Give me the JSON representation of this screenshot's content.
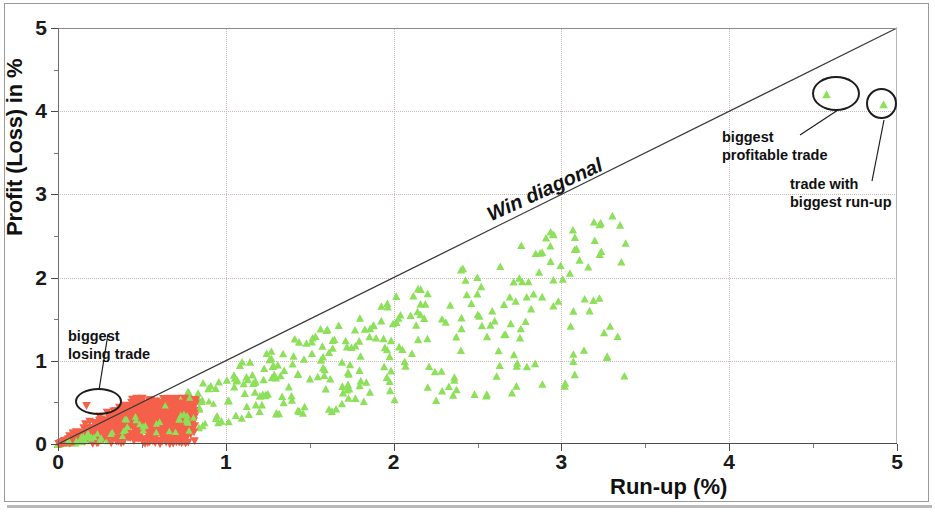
{
  "chart_data": {
    "type": "scatter",
    "title": "",
    "xlabel": "Run-up (%)",
    "ylabel": "Profit (Loss) in %",
    "xlim": [
      0,
      5
    ],
    "ylim": [
      0,
      5
    ],
    "xticks": [
      "0",
      "1",
      "2",
      "3",
      "4",
      "5"
    ],
    "yticks": [
      "0",
      "1",
      "2",
      "3",
      "4",
      "5"
    ],
    "xtick_values": [
      0,
      1,
      2,
      3,
      4,
      5
    ],
    "ytick_values": [
      0,
      1,
      2,
      3,
      4,
      5
    ],
    "minor_tick_step": 0.5,
    "grid": "dotted gridlines at integer ticks",
    "legend": "none",
    "reference_line": {
      "label": "Win diagonal",
      "from": [
        0,
        0
      ],
      "to": [
        5,
        5
      ],
      "note": "y = x diagonal; trades cannot exceed their run-up"
    },
    "series": [
      {
        "name": "losing trades",
        "color": "#F4604A",
        "marker": "triangle-down",
        "count": 520,
        "description": "Dense cluster hugging the origin, run-up 0 to ~0.8%, profit 0 to ~0.55%",
        "x_range": [
          0.0,
          0.82
        ],
        "y_range": [
          0.0,
          0.55
        ]
      },
      {
        "name": "winning trades",
        "color": "#8CE05A",
        "marker": "triangle-up",
        "count": 420,
        "description": "Band below the win diagonal, run-up 0 to ~3.4%, profit 0 to ~2.7%",
        "x_range": [
          0.0,
          3.4
        ],
        "y_range": [
          0.0,
          2.7
        ]
      }
    ],
    "annotations": [
      {
        "label": "biggest\nlosing trade",
        "line1": "biggest",
        "line2": "losing trade",
        "point": [
          0.17,
          0.46
        ],
        "marker": "triangle-down",
        "color": "#F4604A"
      },
      {
        "label": "biggest\nprofitable trade",
        "line1": "biggest",
        "line2": "profitable trade",
        "point": [
          4.58,
          4.2
        ],
        "marker": "triangle-up",
        "color": "#8CE05A"
      },
      {
        "label": "trade with\nbiggest run-up",
        "line1": "trade with",
        "line2": "biggest run-up",
        "point": [
          4.92,
          4.08
        ],
        "marker": "triangle-up",
        "color": "#8CE05A"
      }
    ]
  },
  "axes": {
    "y_label": "Profit (Loss) in %",
    "x_label": "Run-up (%)",
    "y_ticks": [
      "5",
      "4",
      "3",
      "2",
      "1",
      "0"
    ],
    "x_ticks": [
      "0",
      "1",
      "2",
      "3",
      "4",
      "5"
    ]
  },
  "diagonal": {
    "label": "Win diagonal"
  },
  "annotations": {
    "losing": {
      "line1": "biggest",
      "line2": "losing trade"
    },
    "profitable": {
      "line1": "biggest",
      "line2": "profitable trade"
    },
    "runup": {
      "line1": "trade with",
      "line2": "biggest run-up"
    }
  },
  "colors": {
    "loss_marker": "#F4604A",
    "win_marker": "#8CE05A",
    "axis": "#4a4a4a",
    "grid": "#c9b9b9",
    "text": "#111111"
  }
}
